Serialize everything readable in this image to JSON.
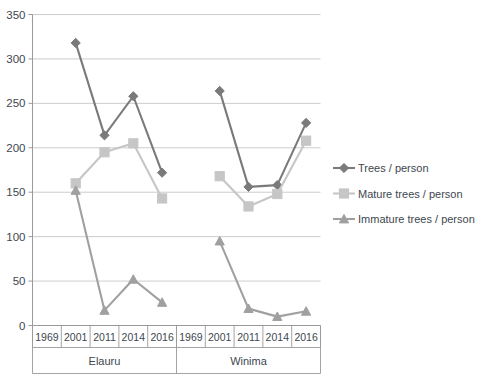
{
  "chart_data": {
    "type": "line",
    "title": "",
    "subtitle": "",
    "xlabel": "",
    "ylabel": "",
    "ylim": [
      0,
      350
    ],
    "ytick_step": 50,
    "yticks": [
      "0",
      "50",
      "100",
      "150",
      "200",
      "250",
      "300",
      "350"
    ],
    "grid": true,
    "legend_position": "right",
    "categories": [
      "1969",
      "2001",
      "2011",
      "2014",
      "2016",
      "1969",
      "2001",
      "2011",
      "2014",
      "2016"
    ],
    "groups": [
      {
        "label": "Elauru",
        "categories": [
          "1969",
          "2001",
          "2011",
          "2014",
          "2016"
        ]
      },
      {
        "label": "Winima",
        "categories": [
          "1969",
          "2001",
          "2011",
          "2014",
          "2016"
        ]
      }
    ],
    "series": [
      {
        "name": "Trees / person",
        "color": "#7a7a7a",
        "marker": "diamond",
        "values": [
          null,
          318,
          214,
          258,
          172,
          null,
          264,
          156,
          158,
          228
        ]
      },
      {
        "name": "Mature trees / person",
        "color": "#c6c6c6",
        "marker": "square",
        "values": [
          null,
          160,
          195,
          205,
          143,
          null,
          168,
          134,
          148,
          208
        ]
      },
      {
        "name": "Immature trees / person",
        "color": "#a0a0a0",
        "marker": "triangle",
        "values": [
          null,
          152,
          17,
          52,
          26,
          null,
          95,
          19,
          10,
          16
        ]
      }
    ]
  },
  "legend": {
    "items": [
      {
        "label": "Trees / person",
        "color": "#7a7a7a",
        "marker": "diamond"
      },
      {
        "label": "Mature trees / person",
        "color": "#c6c6c6",
        "marker": "square"
      },
      {
        "label": "Immature trees / person",
        "color": "#a0a0a0",
        "marker": "triangle"
      }
    ]
  }
}
